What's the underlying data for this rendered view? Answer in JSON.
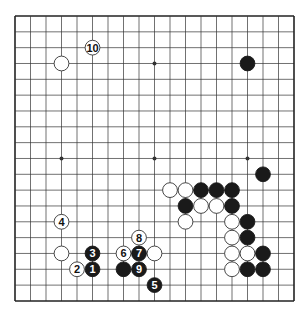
{
  "board": {
    "size": 19,
    "origin": {
      "x": 15,
      "y": 16
    },
    "spacing": {
      "x": 15.5,
      "y": 15.83
    },
    "stone_radius": 7.4,
    "colors": {
      "line": "#333333",
      "border": "#222222",
      "black_stone": "#1a1a1a",
      "white_stone": "#ffffff",
      "white_stone_outline": "#333333",
      "background": "#ffffff"
    },
    "star_points": [
      {
        "col": 3,
        "row": 3
      },
      {
        "col": 9,
        "row": 3
      },
      {
        "col": 15,
        "row": 3
      },
      {
        "col": 3,
        "row": 9
      },
      {
        "col": 9,
        "row": 9
      },
      {
        "col": 15,
        "row": 9
      },
      {
        "col": 3,
        "row": 15
      },
      {
        "col": 9,
        "row": 15
      },
      {
        "col": 15,
        "row": 15
      }
    ]
  },
  "stones": [
    {
      "color": "white",
      "col": 3,
      "row": 3,
      "label": ""
    },
    {
      "color": "black",
      "col": 15,
      "row": 3,
      "label": ""
    },
    {
      "color": "black",
      "col": 16,
      "row": 10,
      "label": ""
    },
    {
      "color": "white",
      "col": 10,
      "row": 11,
      "label": ""
    },
    {
      "color": "white",
      "col": 11,
      "row": 11,
      "label": ""
    },
    {
      "color": "black",
      "col": 12,
      "row": 11,
      "label": ""
    },
    {
      "color": "black",
      "col": 13,
      "row": 11,
      "label": ""
    },
    {
      "color": "black",
      "col": 14,
      "row": 11,
      "label": ""
    },
    {
      "color": "black",
      "col": 11,
      "row": 12,
      "label": ""
    },
    {
      "color": "white",
      "col": 12,
      "row": 12,
      "label": ""
    },
    {
      "color": "white",
      "col": 13,
      "row": 12,
      "label": ""
    },
    {
      "color": "black",
      "col": 14,
      "row": 12,
      "label": ""
    },
    {
      "color": "white",
      "col": 11,
      "row": 13,
      "label": ""
    },
    {
      "color": "white",
      "col": 14,
      "row": 13,
      "label": ""
    },
    {
      "color": "black",
      "col": 15,
      "row": 13,
      "label": ""
    },
    {
      "color": "white",
      "col": 14,
      "row": 14,
      "label": ""
    },
    {
      "color": "black",
      "col": 15,
      "row": 14,
      "label": ""
    },
    {
      "color": "white",
      "col": 3,
      "row": 15,
      "label": ""
    },
    {
      "color": "white",
      "col": 9,
      "row": 15,
      "label": ""
    },
    {
      "color": "white",
      "col": 14,
      "row": 15,
      "label": ""
    },
    {
      "color": "white",
      "col": 15,
      "row": 15,
      "label": ""
    },
    {
      "color": "black",
      "col": 16,
      "row": 15,
      "label": ""
    },
    {
      "color": "black",
      "col": 7,
      "row": 16,
      "label": ""
    },
    {
      "color": "white",
      "col": 14,
      "row": 16,
      "label": ""
    },
    {
      "color": "black",
      "col": 15,
      "row": 16,
      "label": ""
    },
    {
      "color": "black",
      "col": 16,
      "row": 16,
      "label": ""
    },
    {
      "color": "black",
      "col": 5,
      "row": 16,
      "label": "1"
    },
    {
      "color": "white",
      "col": 4,
      "row": 16,
      "label": "2"
    },
    {
      "color": "black",
      "col": 5,
      "row": 15,
      "label": "3"
    },
    {
      "color": "white",
      "col": 3,
      "row": 13,
      "label": "4"
    },
    {
      "color": "black",
      "col": 9,
      "row": 17,
      "label": "5"
    },
    {
      "color": "white",
      "col": 7,
      "row": 15,
      "label": "6"
    },
    {
      "color": "black",
      "col": 8,
      "row": 15,
      "label": "7"
    },
    {
      "color": "white",
      "col": 8,
      "row": 14,
      "label": "8"
    },
    {
      "color": "black",
      "col": 8,
      "row": 16,
      "label": "9"
    },
    {
      "color": "white",
      "col": 5,
      "row": 2,
      "label": "10"
    }
  ]
}
